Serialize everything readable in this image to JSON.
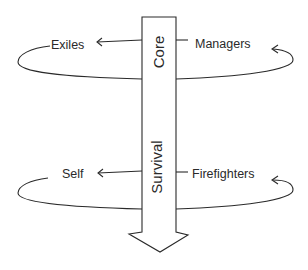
{
  "diagram": {
    "shaft": {
      "upper_label": "Core",
      "lower_label": "Survival",
      "direction": "down"
    },
    "top_loop": {
      "left_label": "Exiles",
      "right_label": "Managers"
    },
    "bottom_loop": {
      "left_label": "Self",
      "right_label": "Firefighters"
    },
    "colors": {
      "line": "#2a2a2a",
      "background": "#ffffff"
    }
  }
}
